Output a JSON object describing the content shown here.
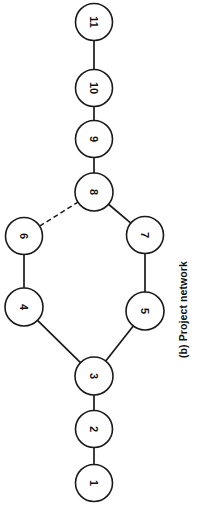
{
  "figure": {
    "caption": "(b) Project network",
    "orientation_deg": -90,
    "background_color": "#ffffff",
    "stroke_color": "#1a1a1a"
  },
  "chart_data": {
    "type": "diagram",
    "title": "(b) Project network",
    "subtitle": "",
    "xlabel": "",
    "ylabel": "",
    "grid": false,
    "legend": null,
    "node_radius": 18.5,
    "nodes": [
      {
        "id": "1",
        "label": "1",
        "cx": 94,
        "cy": 483,
        "r": 18.5
      },
      {
        "id": "2",
        "label": "2",
        "cx": 94,
        "cy": 429,
        "r": 18.5
      },
      {
        "id": "3",
        "label": "3",
        "cx": 94,
        "cy": 376,
        "r": 19.0
      },
      {
        "id": "4",
        "label": "4",
        "cx": 24,
        "cy": 307,
        "r": 19.0
      },
      {
        "id": "5",
        "label": "5",
        "cx": 145,
        "cy": 311,
        "r": 19.0
      },
      {
        "id": "6",
        "label": "6",
        "cx": 24,
        "cy": 236,
        "r": 18.5
      },
      {
        "id": "7",
        "label": "7",
        "cx": 145,
        "cy": 235,
        "r": 18.5
      },
      {
        "id": "8",
        "label": "8",
        "cx": 94,
        "cy": 192,
        "r": 19.0
      },
      {
        "id": "9",
        "label": "9",
        "cx": 94,
        "cy": 139,
        "r": 18.5
      },
      {
        "id": "10",
        "label": "10",
        "cx": 94,
        "cy": 88,
        "r": 18.5
      },
      {
        "id": "11",
        "label": "11",
        "cx": 94,
        "cy": 22,
        "r": 18.5
      }
    ],
    "edges": [
      {
        "from": "1",
        "to": "2",
        "style": "solid"
      },
      {
        "from": "2",
        "to": "3",
        "style": "solid"
      },
      {
        "from": "3",
        "to": "4",
        "style": "solid"
      },
      {
        "from": "3",
        "to": "5",
        "style": "solid"
      },
      {
        "from": "4",
        "to": "6",
        "style": "solid"
      },
      {
        "from": "5",
        "to": "7",
        "style": "solid"
      },
      {
        "from": "6",
        "to": "8",
        "style": "dashed"
      },
      {
        "from": "7",
        "to": "8",
        "style": "solid"
      },
      {
        "from": "8",
        "to": "9",
        "style": "solid"
      },
      {
        "from": "9",
        "to": "10",
        "style": "solid"
      },
      {
        "from": "10",
        "to": "11",
        "style": "solid"
      }
    ]
  }
}
